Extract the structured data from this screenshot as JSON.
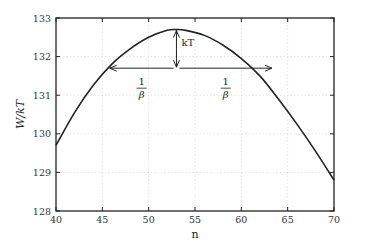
{
  "chart_data": {
    "type": "line",
    "title": "",
    "xlabel": "n",
    "ylabel": "W/kT",
    "xlim": [
      40,
      70
    ],
    "ylim": [
      128,
      133
    ],
    "xticks": [
      40,
      45,
      50,
      55,
      60,
      65,
      70
    ],
    "yticks": [
      128,
      129,
      130,
      131,
      132,
      133
    ],
    "grid": true,
    "legend": null,
    "series": [
      {
        "name": "W/kT",
        "x": [
          40,
          42,
          44,
          46,
          48,
          50,
          52,
          53,
          54,
          56,
          58,
          60,
          62,
          64,
          66,
          68,
          70
        ],
        "y": [
          129.7,
          130.55,
          131.25,
          131.8,
          132.2,
          132.5,
          132.68,
          132.7,
          132.68,
          132.55,
          132.3,
          131.95,
          131.5,
          130.9,
          130.25,
          129.55,
          128.8
        ]
      }
    ],
    "annotations": [
      {
        "type": "vertical-arrow",
        "x": 53,
        "y_from": 132.7,
        "y_to": 131.7,
        "label": "kT"
      },
      {
        "type": "horizontal-arrow",
        "x_from": 53,
        "x_to": 45.8,
        "y": 131.7,
        "label_num": "1",
        "label_den": "β"
      },
      {
        "type": "horizontal-arrow",
        "x_from": 53,
        "x_to": 63.3,
        "y": 131.7,
        "label_num": "1",
        "label_den": "β"
      }
    ]
  }
}
